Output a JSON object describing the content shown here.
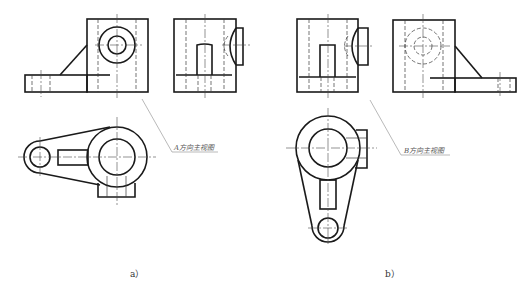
{
  "figure": {
    "panels": [
      {
        "id": "a",
        "caption": "a）",
        "view_label": "A方向主视图",
        "views": [
          "front-view",
          "side-view",
          "top-view"
        ]
      },
      {
        "id": "b",
        "caption": "b）",
        "view_label": "B方向主视图",
        "views": [
          "front-view",
          "side-view",
          "top-view"
        ]
      }
    ]
  },
  "colors": {
    "line": "#1a1a1a",
    "thin_line": "#3a3a3a",
    "leader": "#8a8a8a",
    "background": "#ffffff"
  }
}
